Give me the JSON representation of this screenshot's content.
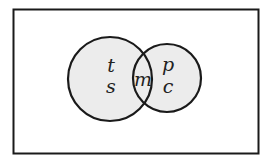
{
  "diagram": {
    "type": "venn",
    "universe": {
      "x": 13,
      "y": 9,
      "width": 245,
      "height": 144
    },
    "sets": [
      {
        "name": "left-set",
        "cx": 110,
        "cy": 79,
        "r": 42,
        "labels": [
          "t",
          "s"
        ]
      },
      {
        "name": "right-set",
        "cx": 167,
        "cy": 78,
        "r": 34,
        "labels": [
          "p",
          "c"
        ]
      }
    ],
    "intersection_label": "m",
    "colors": {
      "fill": "#ececec",
      "stroke": "#1a1a1a",
      "background": "#ffffff"
    }
  }
}
